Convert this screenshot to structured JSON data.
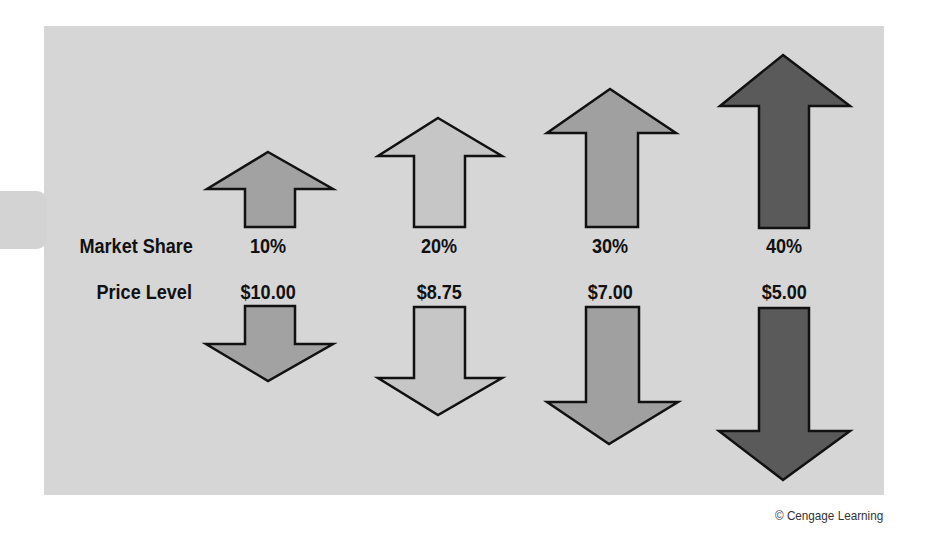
{
  "labels": {
    "market_share": "Market Share",
    "price_level": "Price Level"
  },
  "columns": [
    {
      "market_share": "10%",
      "price_level": "$10.00",
      "color": "#a2a2a2"
    },
    {
      "market_share": "20%",
      "price_level": "$8.75",
      "color": "#c6c6c6"
    },
    {
      "market_share": "30%",
      "price_level": "$7.00",
      "color": "#a0a0a0"
    },
    {
      "market_share": "40%",
      "price_level": "$5.00",
      "color": "#5a5a5a"
    }
  ],
  "credit": "© Cengage Learning",
  "colors": {
    "panel": "#d6d6d6",
    "outline": "#111111"
  }
}
